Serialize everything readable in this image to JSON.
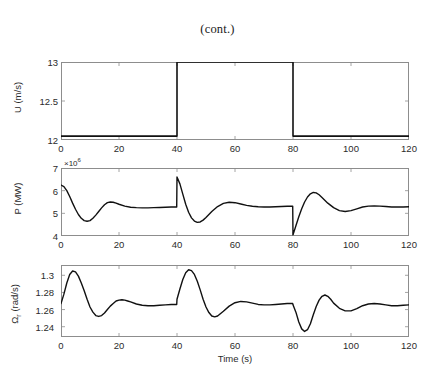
{
  "figure": {
    "title": "(cont.)",
    "xlabel": "Time (s)",
    "line_color": "#111111",
    "axis_color": "#8d8d8d"
  },
  "chart_data": [
    {
      "type": "line",
      "title": "(cont.)",
      "panel": "top",
      "xlabel": "",
      "ylabel": "U (m/s)",
      "ylabel_text": "U (m/s)",
      "xlim": [
        0,
        120
      ],
      "ylim": [
        12,
        13
      ],
      "xticks": [
        0,
        20,
        40,
        60,
        80,
        100,
        120
      ],
      "xtick_labels": [
        "0",
        "20",
        "40",
        "60",
        "80",
        "100",
        "120"
      ],
      "yticks": [
        12,
        12.5,
        13
      ],
      "ytick_labels": [
        "12",
        "12.5",
        "13"
      ],
      "grid": false,
      "legend": "none",
      "series": [
        {
          "name": "U",
          "x": [
            0,
            40,
            40,
            80,
            80,
            120
          ],
          "values": [
            12.05,
            12.05,
            13.0,
            13.0,
            12.05,
            12.05
          ]
        }
      ]
    },
    {
      "type": "line",
      "panel": "middle",
      "xlabel": "",
      "ylabel": "P (MW)",
      "ylabel_text": "P (MW)",
      "y_exponent": "×10",
      "y_exponent_power": "6",
      "xlim": [
        0,
        120
      ],
      "ylim": [
        4,
        7
      ],
      "xticks": [
        0,
        20,
        40,
        60,
        80,
        100,
        120
      ],
      "xtick_labels": [
        "0",
        "20",
        "40",
        "60",
        "80",
        "100",
        "120"
      ],
      "yticks": [
        4,
        5,
        6,
        7
      ],
      "ytick_labels": [
        "4",
        "5",
        "6",
        "7"
      ],
      "grid": false,
      "legend": "none",
      "series": [
        {
          "name": "P",
          "x": [
            0,
            1,
            2,
            3,
            4,
            5,
            6,
            7,
            8,
            9,
            10,
            11,
            12,
            13,
            14,
            15,
            16,
            17,
            18,
            19,
            20,
            22,
            24,
            26,
            28,
            30,
            32,
            34,
            36,
            38,
            39.9,
            40,
            41,
            42,
            43,
            44,
            45,
            46,
            47,
            48,
            49,
            50,
            52,
            54,
            56,
            58,
            60,
            62,
            64,
            66,
            68,
            70,
            72,
            74,
            76,
            78,
            79.9,
            80,
            81,
            82,
            83,
            84,
            85,
            86,
            87,
            88,
            89,
            90,
            92,
            94,
            96,
            98,
            100,
            102,
            104,
            106,
            108,
            110,
            112,
            114,
            116,
            118,
            120
          ],
          "values": [
            6.25,
            6.18,
            6.0,
            5.74,
            5.45,
            5.18,
            4.95,
            4.78,
            4.68,
            4.65,
            4.68,
            4.78,
            4.92,
            5.08,
            5.24,
            5.38,
            5.47,
            5.5,
            5.49,
            5.45,
            5.4,
            5.32,
            5.27,
            5.25,
            5.24,
            5.24,
            5.25,
            5.26,
            5.27,
            5.28,
            5.28,
            6.6,
            6.3,
            5.85,
            5.4,
            5.05,
            4.8,
            4.66,
            4.6,
            4.62,
            4.7,
            4.82,
            5.08,
            5.3,
            5.44,
            5.49,
            5.47,
            5.41,
            5.35,
            5.31,
            5.29,
            5.28,
            5.28,
            5.29,
            5.3,
            5.31,
            5.31,
            4.05,
            4.45,
            4.85,
            5.2,
            5.5,
            5.72,
            5.86,
            5.92,
            5.9,
            5.82,
            5.7,
            5.45,
            5.25,
            5.12,
            5.08,
            5.12,
            5.2,
            5.28,
            5.32,
            5.33,
            5.32,
            5.3,
            5.28,
            5.28,
            5.28,
            5.29
          ]
        }
      ]
    },
    {
      "type": "line",
      "panel": "bottom",
      "xlabel": "Time (s)",
      "ylabel": "Ωr (rad/s)",
      "ylabel_main": "Ω",
      "ylabel_sub": "r",
      "ylabel_tail": " (rad/s)",
      "xlim": [
        0,
        120
      ],
      "ylim": [
        1.228,
        1.312
      ],
      "xticks": [
        0,
        20,
        40,
        60,
        80,
        100,
        120
      ],
      "xtick_labels": [
        "0",
        "20",
        "40",
        "60",
        "80",
        "100",
        "120"
      ],
      "yticks": [
        1.24,
        1.26,
        1.28,
        1.3
      ],
      "ytick_labels": [
        "1.24",
        "1.26",
        "1.28",
        "1.3"
      ],
      "grid": false,
      "legend": "none",
      "series": [
        {
          "name": "Omega_r",
          "x": [
            0,
            1,
            2,
            3,
            4,
            5,
            6,
            7,
            8,
            9,
            10,
            11,
            12,
            13,
            14,
            15,
            16,
            17,
            18,
            19,
            20,
            21,
            22,
            23,
            24,
            26,
            28,
            30,
            32,
            34,
            36,
            38,
            39.9,
            40,
            41,
            42,
            43,
            44,
            45,
            46,
            47,
            48,
            49,
            50,
            51,
            52,
            53,
            54,
            56,
            58,
            60,
            62,
            64,
            66,
            68,
            70,
            72,
            74,
            76,
            78,
            79.9,
            80,
            81,
            82,
            83,
            84,
            85,
            86,
            87,
            88,
            89,
            90,
            91,
            92,
            93,
            94,
            96,
            98,
            100,
            102,
            104,
            106,
            108,
            110,
            112,
            114,
            116,
            118,
            120
          ],
          "values": [
            1.267,
            1.278,
            1.291,
            1.301,
            1.305,
            1.304,
            1.299,
            1.291,
            1.282,
            1.272,
            1.263,
            1.257,
            1.253,
            1.252,
            1.253,
            1.256,
            1.26,
            1.264,
            1.267,
            1.27,
            1.271,
            1.2715,
            1.271,
            1.27,
            1.269,
            1.2665,
            1.265,
            1.2645,
            1.2645,
            1.265,
            1.2655,
            1.266,
            1.266,
            1.272,
            1.284,
            1.295,
            1.303,
            1.3065,
            1.3055,
            1.301,
            1.293,
            1.283,
            1.272,
            1.263,
            1.2565,
            1.2525,
            1.2515,
            1.2525,
            1.258,
            1.264,
            1.268,
            1.2695,
            1.269,
            1.2675,
            1.266,
            1.2655,
            1.2655,
            1.266,
            1.2665,
            1.267,
            1.267,
            1.2655,
            1.257,
            1.2455,
            1.2375,
            1.2345,
            1.2365,
            1.2435,
            1.254,
            1.2635,
            1.271,
            1.2755,
            1.277,
            1.2755,
            1.272,
            1.2675,
            1.2615,
            1.2585,
            1.2585,
            1.261,
            1.2645,
            1.2665,
            1.267,
            1.2665,
            1.2655,
            1.2645,
            1.2645,
            1.265,
            1.2655
          ]
        }
      ]
    }
  ]
}
